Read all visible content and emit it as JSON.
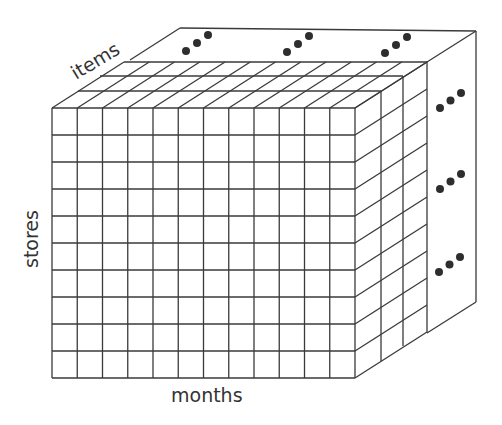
{
  "diagram": {
    "type": "data-cube",
    "labels": {
      "depth_axis": "items",
      "vertical_axis": "stores",
      "horizontal_axis": "months"
    },
    "front_grid": {
      "columns": 12,
      "rows": 10
    },
    "depth_layers_shown": 3,
    "ellipsis_markers": {
      "top": 3,
      "right": 3,
      "symbol": "..."
    },
    "colors": {
      "line": "#3a3a3a",
      "dots": "#2e2e2e",
      "background": "#ffffff"
    }
  }
}
